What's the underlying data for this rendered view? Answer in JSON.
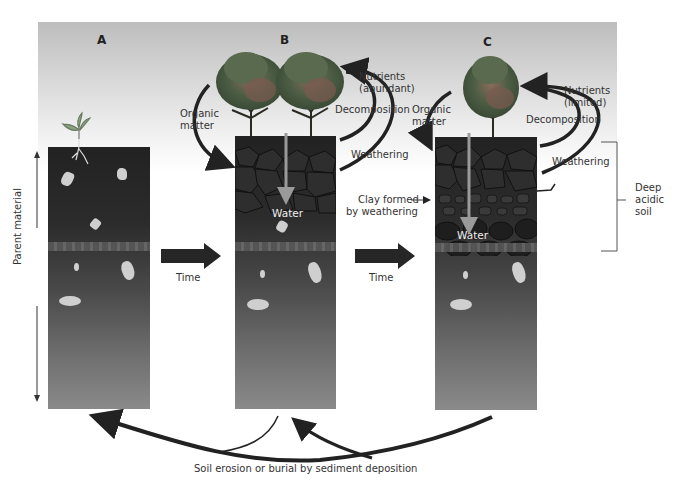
{
  "panels": [
    {
      "id": "A",
      "label": "A"
    },
    {
      "id": "B",
      "label": "B"
    },
    {
      "id": "C",
      "label": "C"
    }
  ],
  "axis": {
    "label": "Parent material"
  },
  "transitions": [
    {
      "label": "Time"
    },
    {
      "label": "Time"
    }
  ],
  "panel_b": {
    "organic_matter": "Organic matter",
    "organic_line1": "Organic",
    "organic_line2": "matter",
    "nutrients_line1": "Nutrients",
    "nutrients_line2": "(abundant)",
    "decomposition": "Decomposition",
    "weathering": "Weathering",
    "water": "Water"
  },
  "panel_c": {
    "organic_line1": "Organic",
    "organic_line2": "matter",
    "nutrients_line1": "Nutrients",
    "nutrients_line2": "(limited)",
    "decomposition": "Decomposition",
    "weathering": "Weathering",
    "water": "Water",
    "clay_line1": "Clay formed",
    "clay_line2": "by weathering",
    "deep_line1": "Deep",
    "deep_line2": "acidic",
    "deep_line3": "soil"
  },
  "bottom": {
    "caption": "Soil erosion or burial by sediment deposition"
  },
  "colors": {
    "soil_dark": "#222222",
    "soil_light": "#8a8a8a",
    "rock": "#cfcfcf",
    "arrow": "#2a2a2a",
    "water_arrow": "#9a9a9a",
    "sky_top": "#bdbdbd"
  }
}
